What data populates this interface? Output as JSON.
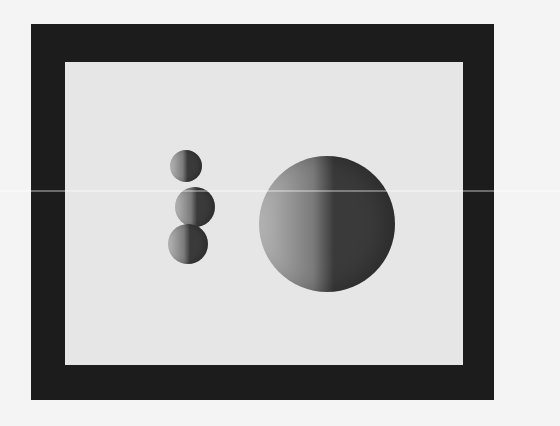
{
  "scene": {
    "description": "Photograph of a display showing shaded spheres inside a dark frame",
    "frame_color": "#1c1c1c",
    "panel_color": "#e6e6e6",
    "background_color": "#f4f4f4",
    "spheres": [
      {
        "name": "small-sphere-top",
        "cx": 186,
        "cy": 166,
        "r": 16
      },
      {
        "name": "small-sphere-middle",
        "cx": 195,
        "cy": 207,
        "r": 20
      },
      {
        "name": "small-sphere-bottom",
        "cx": 188,
        "cy": 244,
        "r": 20
      },
      {
        "name": "large-sphere",
        "cx": 327,
        "cy": 224,
        "r": 68
      }
    ],
    "shading": {
      "light": "#b8b8b8",
      "mid": "#7a7a7a",
      "dark": "#3a3a3a"
    }
  }
}
